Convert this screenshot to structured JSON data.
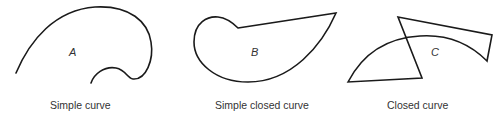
{
  "figures": [
    {
      "id": "A",
      "letter": "A",
      "caption": "Simple curve"
    },
    {
      "id": "B",
      "letter": "B",
      "caption": "Simple closed curve"
    },
    {
      "id": "C",
      "letter": "C",
      "caption": "Closed curve"
    }
  ],
  "colors": {
    "stroke": "#1a1a1a",
    "text": "#333333",
    "background": "#ffffff"
  }
}
